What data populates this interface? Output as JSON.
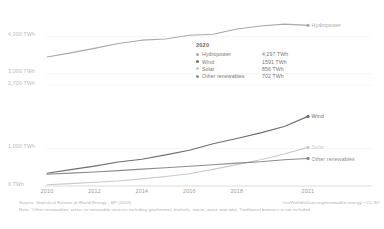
{
  "chart_data": {
    "type": "line",
    "title": "",
    "xlabel": "",
    "ylabel": "",
    "grid": true,
    "legend_position": "inside-center",
    "x": [
      2010,
      2011,
      2012,
      2013,
      2014,
      2015,
      2016,
      2017,
      2018,
      2019,
      2020,
      2021
    ],
    "xtick_labels": [
      "2010",
      "2012",
      "2014",
      "2016",
      "2018",
      "2021"
    ],
    "xticks": [
      2010,
      2012,
      2014,
      2016,
      2018,
      2021
    ],
    "ytick_labels": [
      "4,000 TWh",
      "3,000 TWh",
      "2,700 TWh",
      "1,000 TWh",
      "0 TWh"
    ],
    "yticks": [
      4000,
      3000,
      2700,
      1000,
      0
    ],
    "ylim": [
      0,
      4600
    ],
    "xlim": [
      2010,
      2021
    ],
    "series": [
      {
        "name": "Hydropower",
        "color": "#a9a9a9",
        "end_label": "Hydropower",
        "values": [
          3450,
          3560,
          3680,
          3810,
          3900,
          3930,
          4030,
          4060,
          4200,
          4280,
          4330,
          4297
        ]
      },
      {
        "name": "Wind",
        "color": "#6e6e6e",
        "end_label": "Wind",
        "values": [
          342,
          437,
          531,
          641,
          715,
          832,
          958,
          1130,
          1270,
          1420,
          1591,
          1862
        ]
      },
      {
        "name": "Solar",
        "color": "#c9c9c9",
        "end_label": "Solar",
        "values": [
          32,
          64,
          99,
          135,
          190,
          253,
          328,
          444,
          572,
          702,
          856,
          1033
        ]
      },
      {
        "name": "Other renewables",
        "color": "#8c8c8c",
        "end_label": "Other renewables",
        "values": [
          313,
          344,
          375,
          410,
          450,
          490,
          527,
          570,
          612,
          650,
          702,
          735
        ]
      }
    ]
  },
  "legend": {
    "title": "2020",
    "rows": [
      {
        "name": "Hydropower",
        "value": "4,297 TWh",
        "color": "#a9a9a9"
      },
      {
        "name": "Wind",
        "value": "1591 TWh",
        "color": "#6e6e6e"
      },
      {
        "name": "Solar",
        "value": "856 TWh",
        "color": "#c9c9c9"
      },
      {
        "name": "Other renewables",
        "value": "702 TWh",
        "color": "#8c8c8c"
      }
    ]
  },
  "footer": {
    "source": "Source: Statistical Review of World Energy - BP (2022)",
    "note": "Note: 'Other renewables' refers to renewable sources including geothermal, biofuels, waste, wave and tidal. Traditional biomass is not included.",
    "attribution": "OurWorldInData.org/renewable-energy • CC BY"
  }
}
